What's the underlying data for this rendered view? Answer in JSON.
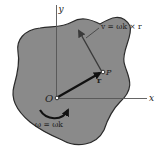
{
  "diagram": {
    "colors": {
      "body_fill": "#8a8a8a",
      "body_stroke": "#2a2a2a",
      "axis": "#555555",
      "vector": "#111111",
      "velocity": "#3a3a3a",
      "background": "#ffffff"
    },
    "axes": {
      "y_label": "y",
      "x_label": "x"
    },
    "points": {
      "origin_label": "O",
      "point_label": "P"
    },
    "vectors": {
      "position_label": "r",
      "velocity_label": "v = ωk × r",
      "angular_velocity_label": "ω = ωk"
    }
  }
}
